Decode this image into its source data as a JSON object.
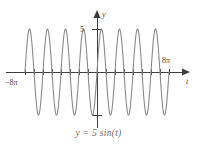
{
  "figure": {
    "caption": "y = 5 sin(t)",
    "background_color": "#ffffff",
    "curve_color": "#8a8a8a",
    "axis_color": "#3d3d3d",
    "label_color": "#4a4a4a",
    "caption_color": "#6e6e6e"
  },
  "axes": {
    "x_axis_variable": "t",
    "y_axis_variable": "y",
    "x_left_label": "−8π",
    "x_right_label": "8π",
    "y_top_label": "5",
    "y_bottom_label": ""
  },
  "chart_data": {
    "type": "line",
    "title": "",
    "subtitle": "",
    "xlabel": "t",
    "ylabel": "y",
    "legend": [],
    "legend_position": "none",
    "grid": false,
    "xlim": [
      -25.1327,
      25.1327
    ],
    "ylim": [
      -5.8,
      5.8
    ],
    "xtick_labels": [
      "−8π",
      "8π"
    ],
    "xtick_values": [
      -25.1327,
      25.1327
    ],
    "ytick_labels": [
      "5"
    ],
    "ytick_values": [
      5
    ],
    "unlabeled_ytick_values": [
      -5
    ],
    "x_tick_spacing_pi": 1,
    "annotations": [
      "y = 5 sin(t)"
    ],
    "series": [
      {
        "name": "y = 5 sin(t)",
        "expression": "5*sin(t)",
        "amplitude": 5,
        "period_pi": 2,
        "cycles_shown": 8,
        "color": "#8a8a8a",
        "x_start": -25.1327,
        "x_end": 25.1327,
        "samples": 800
      }
    ]
  }
}
